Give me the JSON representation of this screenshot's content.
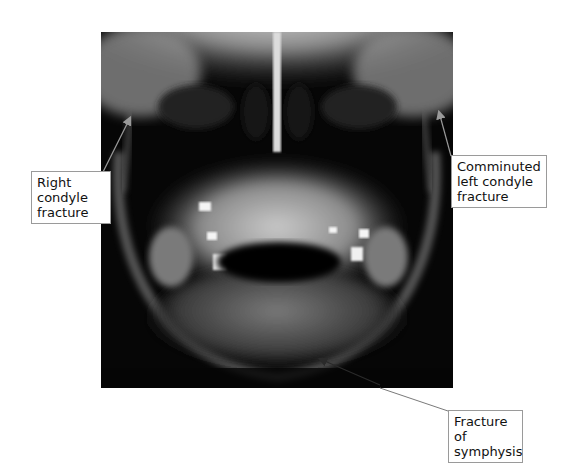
{
  "figure": {
    "annotations": [
      {
        "id": "right-condyle",
        "text": "Right\ncondyle\nfracture"
      },
      {
        "id": "left-condyle",
        "text": "Comminuted\nleft condyle\nfracture"
      },
      {
        "id": "symphysis",
        "text": "Fracture of\nsymphysis"
      }
    ],
    "colors": {
      "background": "#ffffff",
      "xray_base": "#050505",
      "label_border": "#9a9a9a",
      "arrow": "#8a8a8a"
    }
  }
}
